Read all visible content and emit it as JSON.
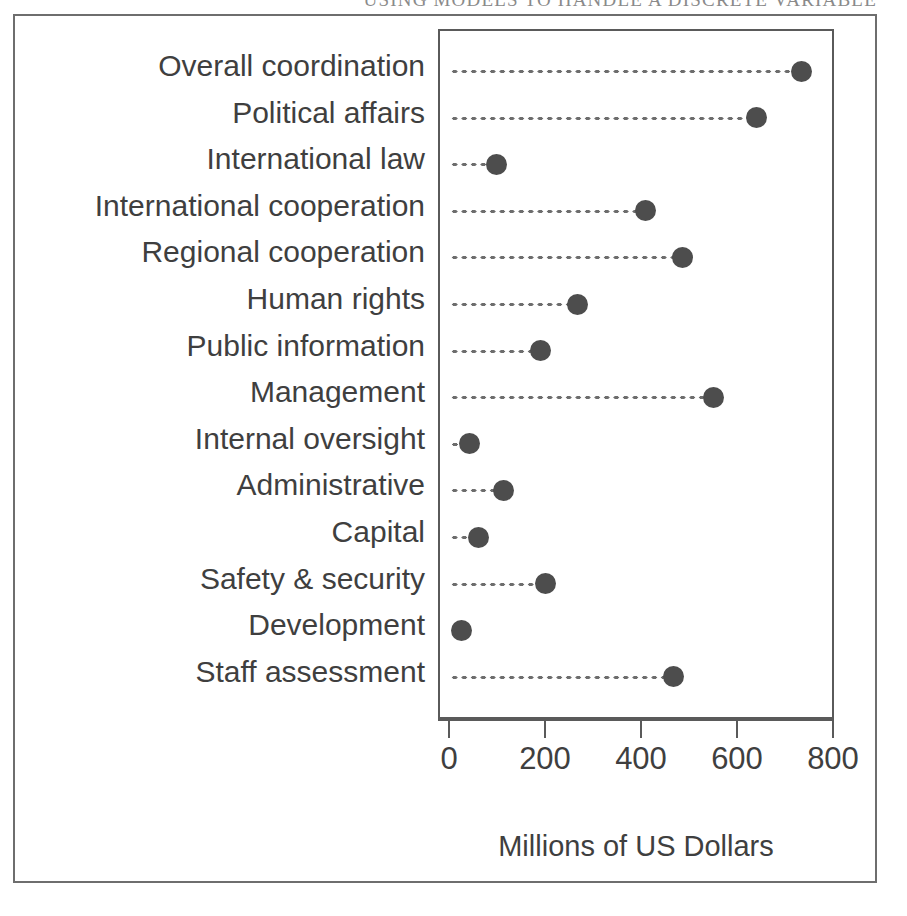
{
  "running_head": "USING MODELS TO HANDLE A DISCRETE VARIABLE",
  "figure": {
    "x_axis_title": "Millions of US Dollars",
    "x_tick_labels": [
      "0",
      "200",
      "400",
      "600",
      "800"
    ],
    "dot_color": "#4d4d4d",
    "axis_color": "#5a5a5a",
    "frame_color": "#6e6e6e",
    "text_color": "#3f3f3f"
  },
  "chart_data": {
    "type": "scatter",
    "title": "",
    "subtitle": "",
    "xlabel": "Millions of US Dollars",
    "ylabel": "",
    "xlim": [
      0,
      800
    ],
    "xticks": [
      0,
      200,
      400,
      600,
      800
    ],
    "grid": false,
    "legend": "none",
    "orientation": "horizontal",
    "style": "cleveland-dot-plot-with-leader-lines",
    "categories": [
      "Overall coordination",
      "Political affairs",
      "International law",
      "International cooperation",
      "Regional cooperation",
      "Human rights",
      "Public information",
      "Management",
      "Internal oversight",
      "Administrative",
      "Capital",
      "Safety & security",
      "Development",
      "Staff assessment"
    ],
    "values": [
      731,
      637,
      94,
      405,
      482,
      263,
      186,
      547,
      38,
      109,
      58,
      196,
      21,
      464
    ],
    "units": "Millions of US Dollars"
  }
}
